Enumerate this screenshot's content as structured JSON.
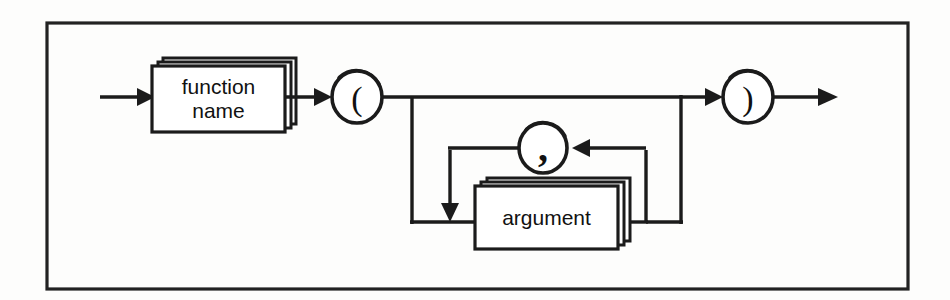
{
  "diagram": {
    "kind": "railroad-syntax-diagram",
    "frame": {
      "visible": true,
      "color": "#222222"
    },
    "ink_color": "#1b1b1b",
    "background_color": "#fdfdfc",
    "nodes": {
      "function_name_box": {
        "label_line1": "function",
        "label_line2": "name",
        "shape": "stacked-rectangle",
        "name": "function-name-nonterminal"
      },
      "open_paren": {
        "label": "(",
        "shape": "circle",
        "name": "open-paren-terminal"
      },
      "comma": {
        "label": ",",
        "shape": "circle",
        "name": "comma-terminal"
      },
      "argument_box": {
        "label": "argument",
        "shape": "stacked-rectangle",
        "name": "argument-nonterminal"
      },
      "close_paren": {
        "label": ")",
        "shape": "circle",
        "name": "close-paren-terminal"
      }
    },
    "paths": [
      "entry arrow into function name",
      "function name to open paren",
      "open paren to close paren (no arguments)",
      "open paren branch down to argument",
      "argument loop back through comma for repetition",
      "argument out to close paren",
      "close paren to exit arrow"
    ]
  }
}
